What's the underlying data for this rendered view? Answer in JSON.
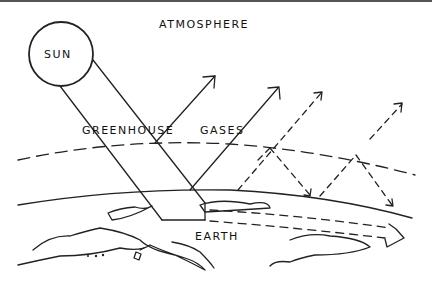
{
  "diagram": {
    "labels": {
      "atmosphere": "ATMOSPHERE",
      "sun": "SUN",
      "greenhouse_gases_1": "GREENHOUSE",
      "greenhouse_gases_2": "GASES",
      "earth": "EARTH"
    },
    "elements": [
      {
        "name": "sun",
        "shape": "circle"
      },
      {
        "name": "sun-rays",
        "shape": "parallel-lines",
        "count": 2
      },
      {
        "name": "reflected-rays",
        "shape": "solid-arrows",
        "count": 2
      },
      {
        "name": "trapped-rays",
        "shape": "dashed-arrows-zigzag",
        "count": 2
      },
      {
        "name": "atmosphere-boundary",
        "shape": "dashed-arc"
      },
      {
        "name": "earth-surface",
        "shape": "solid-arc"
      },
      {
        "name": "heat-flow",
        "shape": "dashed-double-arrow"
      }
    ],
    "colors": {
      "line": "#222222",
      "background": "#ffffff"
    }
  }
}
